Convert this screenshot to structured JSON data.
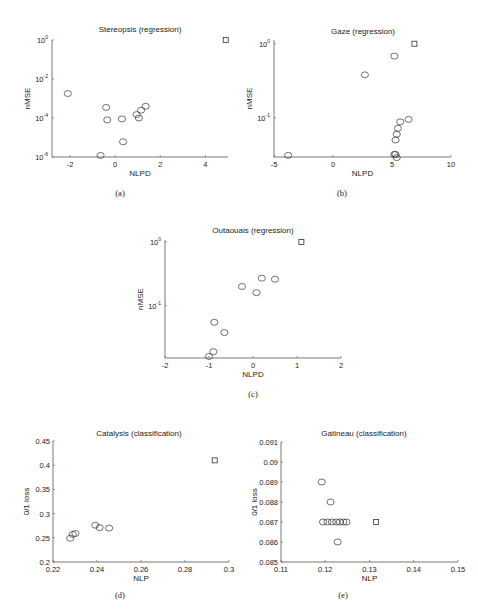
{
  "chart_data": [
    {
      "id": "a",
      "type": "scatter",
      "title": "Stereopsis (regression)",
      "caption": "(a)",
      "xlabel": "NLPD",
      "ylabel": "nMSE",
      "yscale": "log",
      "xlim": [
        -2.8,
        5
      ],
      "ylim": [
        1e-06,
        1
      ],
      "xticks": [
        "-2",
        "0",
        "2",
        "4"
      ],
      "yticks": [
        "10^0",
        "10^-2",
        "10^-4",
        "10^-6"
      ],
      "grid": false,
      "points": [
        {
          "x": -2.1,
          "y": 0.0018,
          "marker": "circle"
        },
        {
          "x": -0.4,
          "y": 0.00035,
          "marker": "circle"
        },
        {
          "x": -0.35,
          "y": 8e-05,
          "marker": "circle"
        },
        {
          "x": 0.3,
          "y": 9e-05,
          "marker": "circle"
        },
        {
          "x": 0.95,
          "y": 0.00015,
          "marker": "circle"
        },
        {
          "x": 1.05,
          "y": 0.0001,
          "marker": "circle"
        },
        {
          "x": 1.15,
          "y": 0.00025,
          "marker": "circle"
        },
        {
          "x": 1.35,
          "y": 0.0004,
          "marker": "circle"
        },
        {
          "x": 0.35,
          "y": 6e-06,
          "marker": "circle"
        },
        {
          "x": -0.65,
          "y": 1.2e-06,
          "marker": "circle"
        },
        {
          "x": 4.9,
          "y": 1.0,
          "marker": "square"
        }
      ]
    },
    {
      "id": "b",
      "type": "scatter",
      "title": "Gaze (regression)",
      "caption": "(b)",
      "xlabel": "NLPD",
      "ylabel": "nMSE",
      "yscale": "log",
      "xlim": [
        -5,
        10
      ],
      "ylim": [
        0.03,
        1.2
      ],
      "xticks": [
        "-5",
        "0",
        "5",
        "10"
      ],
      "yticks": [
        "10^0",
        "10^-1"
      ],
      "grid": false,
      "points": [
        {
          "x": -3.8,
          "y": 0.031,
          "marker": "circle"
        },
        {
          "x": 2.7,
          "y": 0.38,
          "marker": "circle"
        },
        {
          "x": 5.2,
          "y": 0.68,
          "marker": "circle"
        },
        {
          "x": 5.2,
          "y": 0.032,
          "marker": "circle"
        },
        {
          "x": 5.3,
          "y": 0.032,
          "marker": "circle"
        },
        {
          "x": 5.4,
          "y": 0.029,
          "marker": "circle"
        },
        {
          "x": 5.3,
          "y": 0.05,
          "marker": "circle"
        },
        {
          "x": 5.4,
          "y": 0.06,
          "marker": "circle"
        },
        {
          "x": 5.5,
          "y": 0.072,
          "marker": "circle"
        },
        {
          "x": 5.7,
          "y": 0.088,
          "marker": "circle"
        },
        {
          "x": 6.4,
          "y": 0.095,
          "marker": "circle"
        },
        {
          "x": 6.9,
          "y": 1.0,
          "marker": "square"
        }
      ]
    },
    {
      "id": "c",
      "type": "scatter",
      "title": "Outaouais (regression)",
      "caption": "(c)",
      "xlabel": "NLPD",
      "ylabel": "nMSE",
      "yscale": "log",
      "xlim": [
        -2,
        2
      ],
      "ylim": [
        0.015,
        1.2
      ],
      "xticks": [
        "-2",
        "-1",
        "0",
        "1",
        "2"
      ],
      "yticks": [
        "10^0",
        "10^-1"
      ],
      "grid": false,
      "points": [
        {
          "x": -1.0,
          "y": 0.016,
          "marker": "circle"
        },
        {
          "x": -0.9,
          "y": 0.019,
          "marker": "circle"
        },
        {
          "x": -0.88,
          "y": 0.055,
          "marker": "circle"
        },
        {
          "x": -0.65,
          "y": 0.038,
          "marker": "circle"
        },
        {
          "x": -0.25,
          "y": 0.2,
          "marker": "circle"
        },
        {
          "x": 0.08,
          "y": 0.16,
          "marker": "circle"
        },
        {
          "x": 0.2,
          "y": 0.27,
          "marker": "circle"
        },
        {
          "x": 0.5,
          "y": 0.26,
          "marker": "circle"
        },
        {
          "x": 1.1,
          "y": 1.0,
          "marker": "square"
        }
      ]
    },
    {
      "id": "d",
      "type": "scatter",
      "title": "Catalysis (classification)",
      "caption": "(d)",
      "xlabel": "NLP",
      "ylabel": "0/1 loss",
      "yscale": "linear",
      "xlim": [
        0.22,
        0.3
      ],
      "ylim": [
        0.2,
        0.45
      ],
      "xticks": [
        "0.22",
        "0.24",
        "0.26",
        "0.28",
        "0.3"
      ],
      "yticks": [
        "0.45",
        "0.4",
        "0.35",
        "0.3",
        "0.25",
        "0.2"
      ],
      "grid": false,
      "points": [
        {
          "x": 0.2278,
          "y": 0.249,
          "marker": "circle"
        },
        {
          "x": 0.229,
          "y": 0.257,
          "marker": "circle"
        },
        {
          "x": 0.2302,
          "y": 0.259,
          "marker": "circle"
        },
        {
          "x": 0.2392,
          "y": 0.276,
          "marker": "circle"
        },
        {
          "x": 0.2412,
          "y": 0.271,
          "marker": "circle"
        },
        {
          "x": 0.2455,
          "y": 0.27,
          "marker": "circle"
        },
        {
          "x": 0.2935,
          "y": 0.41,
          "marker": "square"
        }
      ]
    },
    {
      "id": "e",
      "type": "scatter",
      "title": "Gatineau (classification)",
      "caption": "(e)",
      "xlabel": "NLP",
      "ylabel": "0/1 loss",
      "yscale": "linear",
      "xlim": [
        0.11,
        0.15
      ],
      "ylim": [
        0.085,
        0.091
      ],
      "xticks": [
        "0.11",
        "0.12",
        "0.13",
        "0.14",
        "0.15"
      ],
      "yticks": [
        "0.091",
        "0.09",
        "0.089",
        "0.088",
        "0.087",
        "0.086",
        "0.085"
      ],
      "grid": false,
      "points": [
        {
          "x": 0.1192,
          "y": 0.089,
          "marker": "circle"
        },
        {
          "x": 0.1212,
          "y": 0.088,
          "marker": "circle"
        },
        {
          "x": 0.1195,
          "y": 0.087,
          "marker": "circle"
        },
        {
          "x": 0.1205,
          "y": 0.087,
          "marker": "circle"
        },
        {
          "x": 0.1215,
          "y": 0.087,
          "marker": "circle"
        },
        {
          "x": 0.1225,
          "y": 0.087,
          "marker": "circle"
        },
        {
          "x": 0.1233,
          "y": 0.087,
          "marker": "circle"
        },
        {
          "x": 0.1241,
          "y": 0.087,
          "marker": "circle"
        },
        {
          "x": 0.1248,
          "y": 0.087,
          "marker": "circle"
        },
        {
          "x": 0.1228,
          "y": 0.086,
          "marker": "circle"
        },
        {
          "x": 0.1315,
          "y": 0.087,
          "marker": "square"
        }
      ]
    }
  ],
  "layout": {
    "panels": {
      "a": {
        "left": 52,
        "right": 228,
        "top": 40,
        "bottom": 157,
        "xmin": -2.8,
        "xmax": 5,
        "ymin": -6,
        "ymax": 0,
        "log": true,
        "xtick_vals": [
          -2,
          0,
          2,
          4
        ],
        "ytick_vals": [
          0,
          -2,
          -4,
          -6
        ],
        "ytick_labels": [
          [
            "10",
            "0"
          ],
          [
            "10",
            "-2"
          ],
          [
            "10",
            "-4"
          ],
          [
            "10",
            "-6"
          ]
        ],
        "title_x": 140,
        "title_y": 32,
        "cap_x": 120,
        "cap_y": 196
      },
      "b": {
        "left": 274,
        "right": 451,
        "top": 40,
        "bottom": 157,
        "xmin": -5,
        "xmax": 10,
        "ymin": -1.53,
        "ymax": 0.05,
        "log": true,
        "xtick_vals": [
          -5,
          0,
          5,
          10
        ],
        "ytick_vals": [
          0,
          -1
        ],
        "ytick_labels": [
          [
            "10",
            "0"
          ],
          [
            "10",
            "-1"
          ]
        ],
        "title_x": 363,
        "title_y": 34,
        "cap_x": 342,
        "cap_y": 196
      },
      "c": {
        "left": 165,
        "right": 341,
        "top": 240,
        "bottom": 358,
        "xmin": -2,
        "xmax": 2,
        "ymin": -1.82,
        "ymax": 0.03,
        "log": true,
        "xtick_vals": [
          -2,
          -1,
          0,
          1,
          2
        ],
        "ytick_vals": [
          0,
          -1
        ],
        "ytick_labels": [
          [
            "10",
            "0"
          ],
          [
            "10",
            "-1"
          ]
        ],
        "title_x": 253,
        "title_y": 233,
        "cap_x": 253,
        "cap_y": 397
      },
      "d": {
        "left": 53,
        "right": 229,
        "top": 441,
        "bottom": 562,
        "xmin": 0.22,
        "xmax": 0.3,
        "ymin": 0.2,
        "ymax": 0.45,
        "log": false,
        "xtick_vals": [
          0.22,
          0.24,
          0.26,
          0.28,
          0.3
        ],
        "ytick_vals": [
          0.45,
          0.4,
          0.35,
          0.3,
          0.25,
          0.2
        ],
        "title_x": 139,
        "title_y": 436,
        "cap_x": 120,
        "cap_y": 598
      },
      "e": {
        "left": 281,
        "right": 458,
        "top": 442,
        "bottom": 562,
        "xmin": 0.11,
        "xmax": 0.15,
        "ymin": 0.085,
        "ymax": 0.091,
        "log": false,
        "xtick_vals": [
          0.11,
          0.12,
          0.13,
          0.14,
          0.15
        ],
        "ytick_vals": [
          0.091,
          0.09,
          0.089,
          0.088,
          0.087,
          0.086,
          0.085
        ],
        "title_x": 364,
        "title_y": 436,
        "cap_x": 343,
        "cap_y": 598
      }
    }
  }
}
